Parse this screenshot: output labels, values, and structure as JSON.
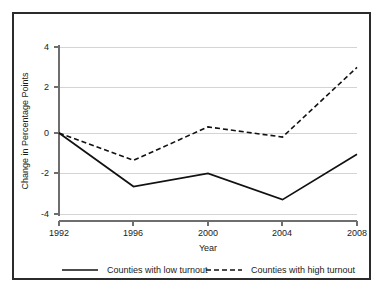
{
  "chart_data": {
    "type": "line",
    "title": "",
    "xlabel": "Year",
    "ylabel": "Change in Percentage Points",
    "x": [
      1992,
      1996,
      2000,
      2004,
      2008
    ],
    "xtick_labels": [
      "1992",
      "1996",
      "2000",
      "2004",
      "2008"
    ],
    "ytick_labels": [
      "4",
      "2",
      "0",
      "-2",
      "-4"
    ],
    "ytick_values": [
      4,
      2,
      0,
      -2,
      -4
    ],
    "ylim": [
      -4,
      4
    ],
    "xlim": [
      1992,
      2008
    ],
    "grid": "horizontal",
    "legend_position": "bottom",
    "series": [
      {
        "name": "Counties with low turnout",
        "style": "solid",
        "color": "#111111",
        "values": [
          0,
          -2.65,
          -2.0,
          -3.3,
          -1.05
        ]
      },
      {
        "name": "Counties with high turnout",
        "style": "dashed",
        "color": "#111111",
        "values": [
          0,
          -1.35,
          0.3,
          -0.2,
          3.25
        ]
      }
    ]
  },
  "legend": {
    "items": [
      {
        "label": "Counties with low turnout",
        "style": "solid"
      },
      {
        "label": "Counties with high turnout",
        "style": "dashed"
      }
    ]
  },
  "axes": {
    "x_title": "Year",
    "y_title": "Change in Percentage Points",
    "x_ticks": [
      "1992",
      "1996",
      "2000",
      "2004",
      "2008"
    ],
    "y_ticks": [
      "4",
      "2",
      "0",
      "-2",
      "-4"
    ]
  }
}
